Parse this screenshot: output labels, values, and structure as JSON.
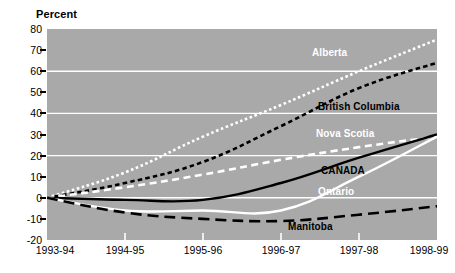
{
  "chart_data": {
    "type": "line",
    "title": "",
    "ylabel": "Percent",
    "xlabel": "",
    "ylim": [
      -20,
      80
    ],
    "ytick_step": 10,
    "yticks": [
      80,
      70,
      60,
      50,
      40,
      30,
      20,
      10,
      0,
      -10,
      -20
    ],
    "ytick_labels": [
      "80",
      "70",
      "60",
      "50",
      "40",
      "30",
      "20",
      "10",
      "0",
      "-10",
      "-20"
    ],
    "gridlines": [
      60,
      40,
      20,
      0
    ],
    "grid": true,
    "grid_color": "#ffffff",
    "plot_bg": "#a9a9a9",
    "legend_position": "inline-labels",
    "categories": [
      "1993-94",
      "1994-95",
      "1995-96",
      "1996-97",
      "1997-98",
      "1998-99"
    ],
    "x": [
      "1993-94",
      "1994-95",
      "1995-96",
      "1996-97",
      "1997-98",
      "1998-99"
    ],
    "series": [
      {
        "name": "Alberta",
        "label_color": "#ffffff",
        "line_color": "#ffffff",
        "line_style": "dotted",
        "values": [
          0,
          12,
          29,
          44,
          60,
          75
        ]
      },
      {
        "name": "British Columbia",
        "label_color": "#000000",
        "line_color": "#000000",
        "line_style": "fine-dashed",
        "values": [
          0,
          7,
          17,
          34,
          52,
          64
        ]
      },
      {
        "name": "Nova Scotia",
        "label_color": "#ffffff",
        "line_color": "#ffffff",
        "line_style": "dashed",
        "values": [
          0,
          5,
          11,
          18,
          24,
          29
        ]
      },
      {
        "name": "CANADA",
        "label_color": "#000000",
        "line_color": "#000000",
        "line_style": "solid",
        "values": [
          0,
          -1,
          -1,
          7,
          19,
          30
        ]
      },
      {
        "name": "Ontario",
        "label_color": "#ffffff",
        "line_color": "#ffffff",
        "line_style": "solid",
        "values": [
          0,
          -6,
          -6,
          -6,
          10,
          29
        ]
      },
      {
        "name": "Manitoba",
        "label_color": "#000000",
        "line_color": "#000000",
        "line_style": "long-dashed",
        "values": [
          0,
          -7,
          -10,
          -11,
          -8,
          -4
        ]
      }
    ],
    "series_label_positions": [
      {
        "name": "Alberta",
        "x_px": 312,
        "y_px": 47
      },
      {
        "name": "British Columbia",
        "x_px": 318,
        "y_px": 101
      },
      {
        "name": "Nova Scotia",
        "x_px": 316,
        "y_px": 128
      },
      {
        "name": "CANADA",
        "x_px": 321,
        "y_px": 165
      },
      {
        "name": "Ontario",
        "x_px": 318,
        "y_px": 186
      },
      {
        "name": "Manitoba",
        "x_px": 288,
        "y_px": 221
      }
    ]
  }
}
